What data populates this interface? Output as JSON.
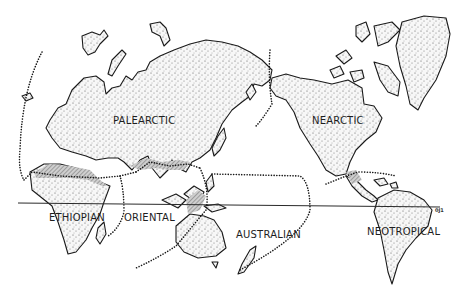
{
  "map": {
    "title": "Zoogeographic realms of the world",
    "realms": [
      {
        "id": "palearctic",
        "label": "PALEARCTIC"
      },
      {
        "id": "nearctic",
        "label": "NEARCTIC"
      },
      {
        "id": "ethiopian",
        "label": "ETHIOPIAN"
      },
      {
        "id": "oriental",
        "label": "ORIENTAL"
      },
      {
        "id": "australian",
        "label": "AUSTRALIAN"
      },
      {
        "id": "neotropical",
        "label": "NEOTROPICAL"
      }
    ],
    "figure_mark": "0J1",
    "legend_marks": {
      "dotted_line": "realm boundary",
      "solid_line": "equator",
      "hatched_band": "transition zone"
    },
    "colors": {
      "ink": "#1a1a1a",
      "paper": "#ffffff",
      "stipple": "#555555",
      "hatch": "#9a9a9a"
    }
  }
}
